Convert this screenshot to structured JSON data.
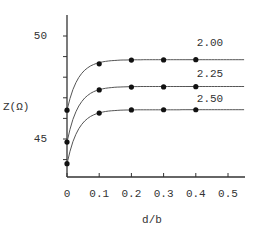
{
  "chart_data": {
    "type": "line",
    "title": "",
    "xlabel": "d/b",
    "ylabel": "Z(Ω)",
    "xlim": [
      0,
      0.55
    ],
    "ylim": [
      43.1,
      51.3
    ],
    "x_ticks": [
      "0",
      "0.1",
      "0.2",
      "0.3",
      "0.4",
      "0.5"
    ],
    "y_ticks": [
      "50",
      "45"
    ],
    "grid": false,
    "legend_position": "inline-right",
    "series": [
      {
        "name": "2.00",
        "x": [
          0,
          0.1,
          0.2,
          0.3,
          0.4
        ],
        "values": [
          46.4,
          48.65,
          48.83,
          48.84,
          48.85
        ],
        "curve_end_x": 0.55,
        "curve_end_y": 48.85
      },
      {
        "name": "2.25",
        "x": [
          0,
          0.1,
          0.2,
          0.3,
          0.4
        ],
        "values": [
          44.85,
          47.38,
          47.52,
          47.53,
          47.54
        ],
        "curve_end_x": 0.55,
        "curve_end_y": 47.55
      },
      {
        "name": "2.50",
        "x": [
          0,
          0.1,
          0.2,
          0.3,
          0.4
        ],
        "values": [
          43.8,
          46.26,
          46.41,
          46.42,
          46.42
        ],
        "curve_end_x": 0.55,
        "curve_end_y": 46.42
      }
    ]
  },
  "labels": {
    "y_axis": "Z(Ω)",
    "x_axis": "d/b",
    "y50": "50",
    "y45": "45",
    "series_label_1": "2.00",
    "series_label_2": "2.25",
    "series_label_3": "2.50"
  }
}
